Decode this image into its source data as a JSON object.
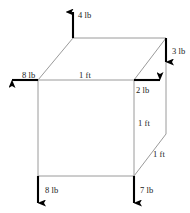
{
  "figure": {
    "type": "free-body-diagram",
    "background_color": "#ffffff",
    "edge_color": "#8c8c8c",
    "arrow_color": "#000000",
    "text_color": "#1a1a1a",
    "force_labels": [
      {
        "id": "force-top-back-left",
        "text": "4 lb",
        "magnitude": 4,
        "unit": "lb",
        "direction": "up",
        "x": 78,
        "y": 11
      },
      {
        "id": "force-top-back-right",
        "text": "3 lb",
        "magnitude": 3,
        "unit": "lb",
        "direction": "down",
        "x": 172,
        "y": 47
      },
      {
        "id": "force-top-front-left",
        "text": "8 lb",
        "magnitude": 8,
        "unit": "lb",
        "direction": "left",
        "x": 22,
        "y": 71
      },
      {
        "id": "force-top-front-right",
        "text": "2 lb",
        "magnitude": 2,
        "unit": "lb",
        "direction": "right",
        "x": 136,
        "y": 86
      },
      {
        "id": "force-bottom-front-left",
        "text": "8 lb",
        "magnitude": 8,
        "unit": "lb",
        "direction": "down",
        "x": 45,
        "y": 186
      },
      {
        "id": "force-bottom-front-right",
        "text": "7 lb",
        "magnitude": 7,
        "unit": "lb",
        "direction": "down",
        "x": 140,
        "y": 186
      }
    ],
    "dimension_labels": [
      {
        "id": "dimension-top-edge",
        "text": "1 ft",
        "value": 1,
        "unit": "ft",
        "edge": "top-front-horizontal",
        "x": 79,
        "y": 71
      },
      {
        "id": "dimension-right-edge",
        "text": "1 ft",
        "value": 1,
        "unit": "ft",
        "edge": "front-right-vertical",
        "x": 138,
        "y": 119
      },
      {
        "id": "dimension-depth-edge",
        "text": "1 ft",
        "value": 1,
        "unit": "ft",
        "edge": "right-face-diagonal",
        "x": 153,
        "y": 150
      }
    ],
    "vertices": {
      "front_top_left": {
        "x": 38,
        "y": 80
      },
      "front_top_right": {
        "x": 134,
        "y": 80
      },
      "front_bottom_left": {
        "x": 38,
        "y": 176
      },
      "front_bottom_right": {
        "x": 134,
        "y": 176
      },
      "back_top_left": {
        "x": 73,
        "y": 38
      },
      "back_top_right": {
        "x": 166,
        "y": 38
      },
      "back_bottom_right": {
        "x": 166,
        "y": 134
      }
    }
  }
}
